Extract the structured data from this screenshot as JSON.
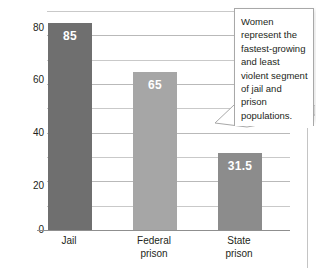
{
  "chart_data": {
    "type": "bar",
    "title": "",
    "subtitle": "",
    "xlabel": "",
    "ylabel": "",
    "categories": [
      "Jail",
      "Federal prison",
      "State prison"
    ],
    "values": [
      85,
      65,
      31.5
    ],
    "value_labels": [
      "85",
      "65",
      "31.5"
    ],
    "series": [
      {
        "name": "Percent",
        "values": [
          85,
          65,
          31.5
        ]
      }
    ],
    "ylim": [
      0,
      90
    ],
    "yticks": [
      0,
      20,
      40,
      60,
      80
    ],
    "ytick_labels": [
      "0",
      "20",
      "40",
      "60",
      "80"
    ],
    "gridline_step": 10,
    "grid": true,
    "legend": false,
    "legend_position": "none",
    "bar_colors": [
      "#6f6f6f",
      "#a6a6a6",
      "#8c8c8c"
    ],
    "annotations": [
      "Women represent the fastest-growing and least violent segment of jail and prison populations."
    ]
  },
  "axis": {
    "yticks": [
      {
        "label": "80",
        "value": 80
      },
      {
        "label": "60",
        "value": 60
      },
      {
        "label": "40",
        "value": 40
      },
      {
        "label": "20",
        "value": 20
      },
      {
        "label": "0",
        "value": 0
      }
    ],
    "xticks": [
      {
        "line1": "Jail",
        "line2": ""
      },
      {
        "line1": "Federal",
        "line2": "prison"
      },
      {
        "line1": "State",
        "line2": "prison"
      }
    ]
  },
  "bars": [
    {
      "category": "Jail",
      "value": 85,
      "label": "85",
      "color": "#6f6f6f"
    },
    {
      "category": "Federal prison",
      "value": 65,
      "label": "65",
      "color": "#a6a6a6"
    },
    {
      "category": "State prison",
      "value": 31.5,
      "label": "31.5",
      "color": "#8c8c8c"
    }
  ],
  "callout": {
    "text": "Women represent the fastest-growing and least violent segment of jail and prison populations."
  },
  "colors": {
    "gridline": "#c9c9c9",
    "baseline": "#8f8f8f",
    "text": "#231f20",
    "callout_border": "#a8a8a8",
    "background": "#ffffff"
  }
}
